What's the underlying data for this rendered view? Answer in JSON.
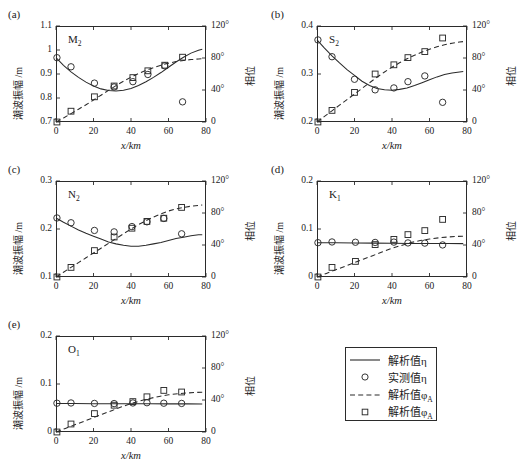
{
  "figure": {
    "x_axis_title": "x/km",
    "y_axis_title": "潮波振幅 /m",
    "y2_axis_title": "相位",
    "x_ticks": [
      "0",
      "20",
      "40",
      "60",
      "80"
    ],
    "x_range": [
      0,
      80
    ],
    "phase_ticks": [
      "0",
      "40°",
      "80°",
      "120°"
    ],
    "phase_range": [
      0,
      120
    ],
    "colors": {
      "ink": "#2b2b2b",
      "background": "#ffffff"
    }
  },
  "legend": {
    "entries": [
      {
        "key": "solid-line",
        "label": "解析值η"
      },
      {
        "key": "circle-marker",
        "label": "实测值η"
      },
      {
        "key": "dashed-line",
        "label": "解析值φ",
        "sub": "A"
      },
      {
        "key": "square-marker",
        "label": "解析值φ",
        "sub": "A"
      }
    ]
  },
  "chart_data": [
    {
      "type": "line",
      "panel": "(a)",
      "title": "M",
      "title_sub": "2",
      "xlabel": "x/km",
      "ylabel": "潮波振幅 /m",
      "y2label": "相位",
      "xlim": [
        0,
        80
      ],
      "ylim": [
        0.7,
        1.1
      ],
      "y_ticks": [
        "0.7",
        "0.8",
        "0.9",
        "1",
        "1.1"
      ],
      "y2lim": [
        0,
        120
      ],
      "y2_ticks": [
        "0",
        "40°",
        "80°",
        "120°"
      ],
      "series": [
        {
          "name": "解析值η",
          "style": "solid",
          "x": [
            0,
            4,
            8,
            12,
            16,
            20,
            24,
            28,
            32,
            36,
            40,
            44,
            48,
            52,
            56,
            60,
            64,
            68,
            72,
            76,
            78
          ],
          "y": [
            0.968,
            0.936,
            0.909,
            0.886,
            0.866,
            0.85,
            0.838,
            0.831,
            0.829,
            0.832,
            0.84,
            0.852,
            0.868,
            0.886,
            0.906,
            0.928,
            0.95,
            0.97,
            0.987,
            0.999,
            1.003
          ]
        },
        {
          "name": "实测值η",
          "style": "circle",
          "x": [
            0.5,
            8,
            20.5,
            31,
            41,
            49,
            58,
            67.5
          ],
          "y": [
            0.968,
            0.93,
            0.862,
            0.846,
            0.868,
            0.898,
            0.934,
            0.784
          ]
        },
        {
          "name": "解析值φA",
          "style": "dashed",
          "x": [
            0,
            4,
            8,
            12,
            16,
            20,
            24,
            28,
            32,
            36,
            40,
            44,
            48,
            52,
            56,
            60,
            64,
            68,
            72,
            76,
            78
          ],
          "phase": [
            0,
            5,
            10.5,
            16,
            21.5,
            27.5,
            33.5,
            39.5,
            45.5,
            51,
            56,
            60.5,
            64.5,
            68,
            71,
            73.5,
            75.5,
            77,
            78,
            78.8,
            79
          ]
        },
        {
          "name": "解析值φA-points",
          "style": "square",
          "x": [
            0.5,
            8,
            20.5,
            31,
            41,
            49,
            58,
            67.5
          ],
          "phase": [
            0,
            13.5,
            31.5,
            45,
            55.5,
            64,
            71,
            81
          ]
        }
      ]
    },
    {
      "type": "line",
      "panel": "(b)",
      "title": "S",
      "title_sub": "2",
      "xlabel": "x/km",
      "ylabel": "潮波振幅 /m",
      "y2label": "相位",
      "xlim": [
        0,
        80
      ],
      "ylim": [
        0.2,
        0.4
      ],
      "y_ticks": [
        "0.2",
        "0.3",
        "0.4"
      ],
      "y2lim": [
        0,
        120
      ],
      "y2_ticks": [
        "0",
        "40°",
        "80°",
        "120°"
      ],
      "series": [
        {
          "name": "解析值η",
          "style": "solid",
          "x": [
            0,
            4,
            8,
            12,
            16,
            20,
            24,
            28,
            32,
            36,
            40,
            44,
            48,
            52,
            56,
            60,
            64,
            68,
            72,
            76,
            78
          ],
          "y": [
            0.371,
            0.354,
            0.338,
            0.323,
            0.309,
            0.297,
            0.285,
            0.276,
            0.27,
            0.267,
            0.266,
            0.268,
            0.271,
            0.276,
            0.282,
            0.288,
            0.294,
            0.299,
            0.302,
            0.304,
            0.305
          ]
        },
        {
          "name": "实测值η",
          "style": "circle",
          "x": [
            0.5,
            8,
            20,
            31,
            41,
            48.5,
            57.5,
            67
          ],
          "y": [
            0.371,
            0.336,
            0.289,
            0.267,
            0.271,
            0.284,
            0.296,
            0.241
          ]
        },
        {
          "name": "解析值φA",
          "style": "dashed",
          "x": [
            0,
            4,
            8,
            12,
            16,
            20,
            24,
            28,
            32,
            36,
            40,
            44,
            48,
            52,
            56,
            60,
            64,
            68,
            72,
            76,
            78
          ],
          "phase": [
            0,
            7,
            14,
            21,
            28,
            35,
            42,
            49,
            56,
            62.5,
            68.5,
            74,
            79,
            83.5,
            87.5,
            91,
            94,
            96.5,
            98.5,
            100,
            100.5
          ]
        },
        {
          "name": "解析值φA-points",
          "style": "square",
          "x": [
            0.5,
            8,
            20,
            31,
            41,
            48.5,
            57.5,
            67
          ],
          "phase": [
            0,
            14.5,
            37,
            60,
            71.5,
            80.5,
            88,
            105
          ]
        }
      ]
    },
    {
      "type": "line",
      "panel": "(c)",
      "title": "N",
      "title_sub": "2",
      "xlabel": "x/km",
      "ylabel": "潮波振幅 /m",
      "y2label": "相位",
      "xlim": [
        0,
        80
      ],
      "ylim": [
        0.1,
        0.3
      ],
      "y_ticks": [
        "0.1",
        "0.2",
        "0.3"
      ],
      "y2lim": [
        0,
        120
      ],
      "y2_ticks": [
        "0",
        "40°",
        "80°",
        "120°"
      ],
      "series": [
        {
          "name": "解析值η",
          "style": "solid",
          "x": [
            0,
            4,
            8,
            12,
            16,
            20,
            24,
            28,
            32,
            36,
            40,
            44,
            48,
            52,
            56,
            60,
            64,
            68,
            72,
            76,
            78
          ],
          "y": [
            0.223,
            0.214,
            0.206,
            0.198,
            0.191,
            0.185,
            0.179,
            0.173,
            0.169,
            0.166,
            0.164,
            0.164,
            0.166,
            0.169,
            0.172,
            0.176,
            0.18,
            0.183,
            0.186,
            0.188,
            0.188
          ]
        },
        {
          "name": "实测值η",
          "style": "circle",
          "x": [
            0.5,
            8,
            20.5,
            31,
            40.5,
            48.5,
            57.5,
            67
          ],
          "y": [
            0.223,
            0.213,
            0.197,
            0.194,
            0.205,
            0.215,
            0.222,
            0.19
          ]
        },
        {
          "name": "解析值φA",
          "style": "dashed",
          "x": [
            0,
            4,
            8,
            12,
            16,
            20,
            24,
            28,
            32,
            36,
            40,
            44,
            48,
            52,
            56,
            60,
            64,
            68,
            72,
            76,
            78
          ],
          "phase": [
            0,
            6,
            12,
            18,
            24,
            30,
            36,
            42,
            48,
            54,
            60,
            65.5,
            70.5,
            75,
            79,
            82.5,
            85,
            87,
            88.5,
            89.5,
            90
          ]
        },
        {
          "name": "解析值φA-points",
          "style": "square",
          "x": [
            0.5,
            8,
            20.5,
            31,
            40.5,
            48.5,
            57.5,
            67
          ],
          "phase": [
            0,
            12,
            33,
            50,
            61,
            69.5,
            73.5,
            87
          ]
        }
      ]
    },
    {
      "type": "line",
      "panel": "(d)",
      "title": "K",
      "title_sub": "1",
      "xlabel": "x/km",
      "ylabel": "潮波振幅 /m",
      "y2label": "相位",
      "xlim": [
        0,
        80
      ],
      "ylim": [
        0,
        0.2
      ],
      "y_ticks": [
        "0",
        "0.1",
        "0.2"
      ],
      "y2lim": [
        0,
        120
      ],
      "y2_ticks": [
        "0",
        "40°",
        "80°",
        "120°"
      ],
      "series": [
        {
          "name": "解析值η",
          "style": "solid",
          "x": [
            0,
            10,
            20,
            30,
            40,
            50,
            60,
            70,
            78
          ],
          "y": [
            0.0715,
            0.0713,
            0.071,
            0.0706,
            0.0702,
            0.0699,
            0.0697,
            0.0696,
            0.0695
          ]
        },
        {
          "name": "实测值η",
          "style": "circle",
          "x": [
            0.5,
            8,
            20.5,
            31,
            41,
            48.5,
            57.5,
            67
          ],
          "y": [
            0.0715,
            0.073,
            0.0724,
            0.072,
            0.0727,
            0.071,
            0.0706,
            0.0668
          ]
        },
        {
          "name": "解析值φA",
          "style": "dashed",
          "x": [
            0,
            5,
            10,
            15,
            20,
            25,
            30,
            35,
            40,
            45,
            50,
            55,
            60,
            65,
            70,
            75,
            78
          ],
          "phase": [
            0,
            4.5,
            9,
            13.5,
            18,
            22.5,
            27,
            31.5,
            36,
            39.5,
            43,
            45.5,
            47.5,
            49,
            50,
            50.8,
            51
          ]
        },
        {
          "name": "解析值φA-points",
          "style": "square",
          "x": [
            0.5,
            8,
            20.5,
            31,
            41,
            48.5,
            57.5,
            67
          ],
          "phase": [
            0,
            12,
            19.5,
            40.5,
            47,
            53,
            58,
            72
          ]
        }
      ]
    },
    {
      "type": "line",
      "panel": "(e)",
      "title": "O",
      "title_sub": "1",
      "xlabel": "x/km",
      "ylabel": "潮波振幅 /m",
      "y2label": "相位",
      "xlim": [
        0,
        80
      ],
      "ylim": [
        0,
        0.2
      ],
      "y_ticks": [
        "0",
        "0.1",
        "0.2"
      ],
      "y2lim": [
        0,
        120
      ],
      "y2_ticks": [
        "0",
        "40°",
        "80°",
        "120°"
      ],
      "series": [
        {
          "name": "解析值η",
          "style": "solid",
          "x": [
            0,
            10,
            20,
            30,
            40,
            50,
            60,
            70,
            78
          ],
          "y": [
            0.0593,
            0.0592,
            0.059,
            0.0589,
            0.0588,
            0.0587,
            0.0586,
            0.0586,
            0.0585
          ]
        },
        {
          "name": "实测值η",
          "style": "circle",
          "x": [
            0.5,
            8,
            20.5,
            31,
            41,
            48.5,
            57.5,
            67
          ],
          "y": [
            0.06,
            0.0605,
            0.0595,
            0.0592,
            0.0605,
            0.061,
            0.06,
            0.0595
          ]
        },
        {
          "name": "解析值φA",
          "style": "dashed",
          "x": [
            0,
            5,
            10,
            15,
            20,
            25,
            30,
            35,
            40,
            45,
            50,
            55,
            60,
            65,
            70,
            75,
            78
          ],
          "phase": [
            0,
            4.5,
            9,
            13.5,
            18,
            22.5,
            27,
            31.5,
            35.5,
            39,
            42,
            44.5,
            46.5,
            47.8,
            48.8,
            49.5,
            49.8
          ]
        },
        {
          "name": "解析值φA-points",
          "style": "square",
          "x": [
            0.5,
            8,
            20.5,
            31,
            41,
            48.5,
            57.5,
            67
          ],
          "phase": [
            0,
            10,
            23,
            33.5,
            38,
            44,
            52,
            50
          ]
        }
      ]
    }
  ]
}
